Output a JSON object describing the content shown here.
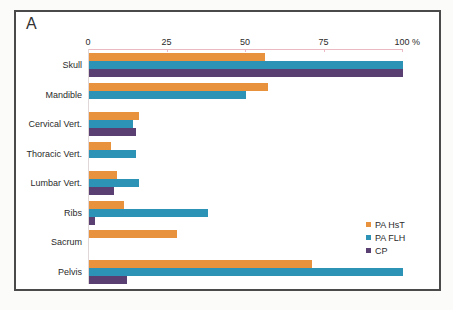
{
  "panel_label": "A",
  "colors": {
    "frame_border": "#4a4a4a",
    "axis_line": "#eab9c1",
    "left_axis_line": "#e0d7d9",
    "text": "#2b2b2b"
  },
  "chart_data": {
    "type": "bar",
    "orientation": "horizontal",
    "title": "",
    "xlabel": "",
    "ylabel": "",
    "unit_label": "%",
    "axis": {
      "position": "top",
      "min": 0,
      "max": 100,
      "ticks": [
        0,
        25,
        50,
        75,
        100
      ],
      "grid": false
    },
    "categories": [
      "Skull",
      "Mandible",
      "Cervical Vert.",
      "Thoracic Vert.",
      "Lumbar Vert.",
      "Ribs",
      "Sacrum",
      "Pelvis"
    ],
    "series": [
      {
        "name": "PA HsT",
        "color": "#e8923e",
        "values": [
          56,
          57,
          16,
          7,
          9,
          11,
          28,
          71
        ]
      },
      {
        "name": "PA FLH",
        "color": "#2c93b7",
        "values": [
          100,
          50,
          14,
          15,
          16,
          38,
          0,
          100
        ]
      },
      {
        "name": "CP",
        "color": "#5a3f73",
        "values": [
          100,
          0,
          15,
          0,
          8,
          2,
          0,
          12
        ]
      }
    ],
    "legend": {
      "position": "right",
      "entries": [
        "PA HsT",
        "PA FLH",
        "CP"
      ]
    }
  }
}
